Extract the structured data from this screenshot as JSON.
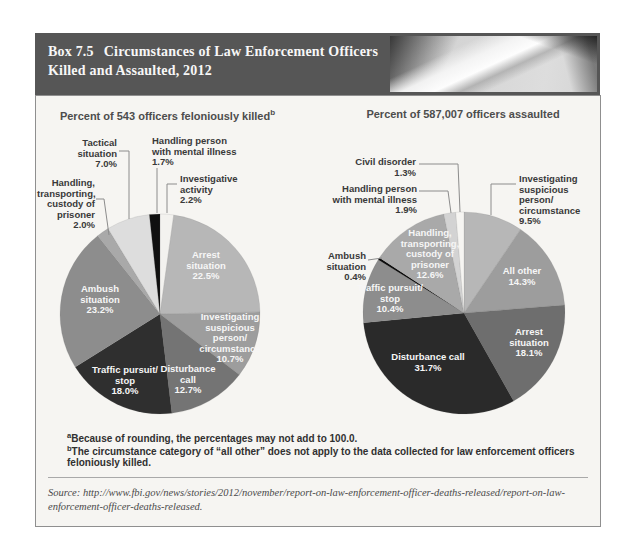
{
  "page": {
    "header": {
      "box_label": "Box 7.5",
      "title": "Circumstances of Law Enforcement Officers Killed and Assaulted, 2012"
    },
    "footnotes": [
      {
        "sup": "a",
        "text": "Because of rounding, the percentages may not add to 100.0."
      },
      {
        "sup": "b",
        "text": "The circumstance category of “all other” does not apply to the data collected for law enforcement officers feloniously killed."
      }
    ],
    "source": "Source: http://www.fbi.gov/news/stories/2012/november/report-on-law-enforcement-officer-deaths-released/report-on-law-enforcement-officer-deaths-released."
  },
  "chart_data": [
    {
      "type": "pie",
      "title": "Percent of 543 officers feloniously killed",
      "title_sup": "b",
      "legend": "none; labels inside slices and as callouts",
      "start_angle_deg": 0,
      "direction": "clockwise from 12 o'clock",
      "slices": [
        {
          "label": "Investigative activity",
          "value": 2.2,
          "color": "#f3f2ef",
          "display": "Investigative\nactivity\n2.2%"
        },
        {
          "label": "Arrest situation",
          "value": 22.5,
          "color": "#b7b7b7",
          "display": "Arrest\nsituation\n22.5%"
        },
        {
          "label": "Investigating suspicious person/circumstance",
          "value": 10.7,
          "color": "#9d9d9d",
          "display": "Investigating\nsuspicious\nperson/\ncircumstance\n10.7%"
        },
        {
          "label": "Disturbance call",
          "value": 12.7,
          "color": "#747474",
          "display": "Disturbance\ncall\n12.7%"
        },
        {
          "label": "Traffic pursuit/stop",
          "value": 18.0,
          "color": "#2f2f2f",
          "display": "Traffic pursuit/\nstop\n18.0%"
        },
        {
          "label": "Ambush situation",
          "value": 23.2,
          "color": "#8d8d8d",
          "display": "Ambush\nsituation\n23.2%"
        },
        {
          "label": "Handling, transporting, custody of prisoner",
          "value": 2.0,
          "color": "#a9a9a9",
          "display": "Handling,\ntransporting,\ncustody of\nprisoner\n2.0%"
        },
        {
          "label": "Tactical situation",
          "value": 7.0,
          "color": "#dddddd",
          "display": "Tactical\nsituation\n7.0%"
        },
        {
          "label": "Handling person with mental illness",
          "value": 1.7,
          "color": "#101010",
          "display": "Handling person\nwith mental illness\n1.7%"
        }
      ]
    },
    {
      "type": "pie",
      "title": "Percent of 587,007 officers assaulted",
      "legend": "none; labels inside slices and as callouts",
      "start_angle_deg": 0,
      "direction": "clockwise from 12 o'clock",
      "slices": [
        {
          "label": "Investigating suspicious person/circumstance",
          "value": 9.5,
          "color": "#b7b7b7",
          "display": "Investigating\nsuspicious\nperson/\ncircumstance\n9.5%"
        },
        {
          "label": "All other",
          "value": 14.3,
          "color": "#9d9d9d",
          "display": "All other\n14.3%"
        },
        {
          "label": "Arrest situation",
          "value": 18.1,
          "color": "#6e6e6e",
          "display": "Arrest\nsituation\n18.1%"
        },
        {
          "label": "Disturbance call",
          "value": 31.7,
          "color": "#2a2a2a",
          "display": "Disturbance call\n31.7%"
        },
        {
          "label": "Traffic pursuit/stop",
          "value": 10.4,
          "color": "#8d8d8d",
          "display": "Traffic pursuit/\nstop\n10.4%"
        },
        {
          "label": "Ambush situation",
          "value": 0.4,
          "color": "#0d0d0d",
          "display": "Ambush\nsituation\n0.4%"
        },
        {
          "label": "Handling, transporting, custody of prisoner",
          "value": 12.6,
          "color": "#a9a9a9",
          "display": "Handling,\ntransporting,\ncustody of\nprisoner\n12.6%"
        },
        {
          "label": "Handling person with mental illness",
          "value": 1.9,
          "color": "#d3d3d3",
          "display": "Handling person\nwith mental illness\n1.9%"
        },
        {
          "label": "Civil disorder",
          "value": 1.3,
          "color": "#f6f5f2",
          "display": "Civil disorder\n1.3%"
        }
      ]
    }
  ]
}
